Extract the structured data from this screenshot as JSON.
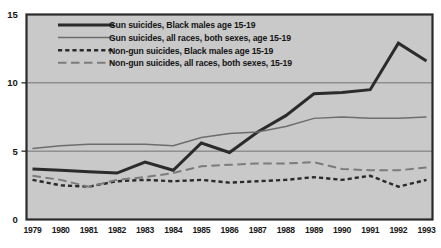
{
  "chart_data": {
    "type": "line",
    "title": "",
    "xlabel": "",
    "ylabel": "",
    "categories": [
      "1979",
      "1980",
      "1981",
      "1982",
      "1983",
      "1984",
      "1985",
      "1986",
      "1987",
      "1988",
      "1989",
      "1990",
      "1991",
      "1992",
      "1993"
    ],
    "xlim": [
      1979,
      1993
    ],
    "ylim": [
      0,
      15
    ],
    "yticks": [
      0,
      5,
      10,
      15
    ],
    "ytick_labels": [
      "0",
      "5",
      "10",
      "15"
    ],
    "grid": "horizontal-at-5-and-10",
    "legend_position": "upper-left-inside",
    "series": [
      {
        "name": "Gun suicides, Black males age 15-19",
        "style": "solid-thick-black",
        "color": "#2b2b2b",
        "values": [
          3.7,
          3.6,
          3.5,
          3.4,
          4.2,
          3.6,
          5.6,
          4.9,
          6.4,
          7.6,
          9.2,
          9.3,
          9.5,
          12.9,
          11.6
        ]
      },
      {
        "name": "Gun suicides, all races, both sexes, age 15-19",
        "style": "solid-thin-grey",
        "color": "#6d6d6d",
        "values": [
          5.2,
          5.4,
          5.5,
          5.5,
          5.5,
          5.4,
          6.0,
          6.3,
          6.4,
          6.8,
          7.4,
          7.5,
          7.4,
          7.4,
          7.5
        ]
      },
      {
        "name": "Non-gun suicides, Black males age 15-19",
        "style": "dotted-dash-black",
        "color": "#2b2b2b",
        "values": [
          2.9,
          2.5,
          2.4,
          2.8,
          2.9,
          2.8,
          2.9,
          2.7,
          2.8,
          2.9,
          3.1,
          2.9,
          3.2,
          2.4,
          2.9
        ]
      },
      {
        "name": "Non-gun suicides, all races, both sexes, 15-19",
        "style": "long-dash-grey",
        "color": "#7b7b7b",
        "values": [
          3.2,
          2.9,
          2.4,
          2.9,
          3.1,
          3.4,
          3.9,
          4.0,
          4.1,
          4.1,
          4.2,
          3.7,
          3.6,
          3.6,
          3.8
        ]
      }
    ]
  },
  "legend": {
    "items": [
      {
        "label": "Gun suicides, Black males age 15-19"
      },
      {
        "label": "Gun suicides, all races, both sexes, age 15-19"
      },
      {
        "label": "Non-gun suicides, Black males age 15-19"
      },
      {
        "label": "Non-gun suicides, all races, both sexes, 15-19"
      }
    ]
  },
  "colors": {
    "plot_background": "#c9c9c9",
    "plot_border": "#2a2a2a",
    "gridline": "#6a6a6a",
    "series_black": "#2b2b2b",
    "series_grey": "#6d6d6d",
    "series_grey_dash": "#7b7b7b",
    "text": "#151515",
    "page_background": "#ffffff"
  }
}
